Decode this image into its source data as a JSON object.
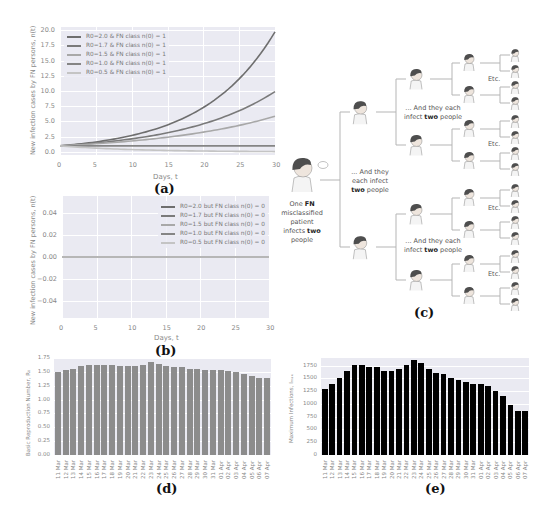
{
  "panels": {
    "a": {
      "label": "(a)"
    },
    "b": {
      "label": "(b)"
    },
    "c": {
      "label": "(c)"
    },
    "d": {
      "label": "(d)"
    },
    "e": {
      "label": "(e)"
    }
  },
  "tree": {
    "root_text_1": "One ",
    "root_bold_1": "FN",
    "root_text_2": "misclassified",
    "root_text_3": "patient",
    "root_text_4": "infects ",
    "root_bold_2": "two",
    "root_text_5": "people",
    "level1_text_1": "... And they",
    "level1_text_2": "each infect",
    "level1_bold": "two",
    "level1_text_3": " people",
    "level2_text_1": "... And they each",
    "level2_text_2": "infect ",
    "level2_bold": "two",
    "level2_text_3": " people",
    "etc": "Etc."
  },
  "chart_data": [
    {
      "id": "a",
      "type": "line",
      "title": "",
      "xlabel": "Days, t",
      "ylabel": "New infection cases by FN persons, n(t)",
      "xlim": [
        0,
        30
      ],
      "ylim": [
        -0.5,
        20.5
      ],
      "xticks": [
        "0",
        "5",
        "10",
        "15",
        "20",
        "25",
        "30"
      ],
      "yticks": [
        "0.0",
        "2.5",
        "5.0",
        "7.5",
        "10.0",
        "12.5",
        "15.0",
        "17.5",
        "20.0"
      ],
      "grid": true,
      "legend_position": "upper left",
      "x": [
        0,
        5,
        10,
        15,
        20,
        25,
        30
      ],
      "series": [
        {
          "name": "R0=2.0 & FN class n(0) = 1",
          "color": "#6e6e6e",
          "values": [
            1.0,
            1.6,
            2.7,
            4.4,
            7.3,
            12.0,
            19.7
          ]
        },
        {
          "name": "R0=1.7 & FN class n(0) = 1",
          "color": "#7a7a7a",
          "values": [
            1.0,
            1.47,
            2.15,
            3.15,
            4.6,
            6.75,
            9.9
          ]
        },
        {
          "name": "R0=1.5 & FN class n(0) = 1",
          "color": "#a8a8a8",
          "values": [
            1.0,
            1.35,
            1.8,
            2.45,
            3.3,
            4.4,
            5.85
          ]
        },
        {
          "name": "R0=1.0 & FN class n(0) = 1",
          "color": "#858585",
          "values": [
            1.0,
            1.0,
            1.0,
            1.0,
            1.0,
            1.0,
            1.0
          ]
        },
        {
          "name": "R0=0.5 & FN class n(0) = 1",
          "color": "#c4c4c4",
          "values": [
            1.0,
            0.62,
            0.4,
            0.25,
            0.16,
            0.1,
            0.06
          ]
        }
      ]
    },
    {
      "id": "b",
      "type": "line",
      "title": "",
      "xlabel": "Days, t",
      "ylabel": "New infection cases by FN persons, n(t)",
      "xlim": [
        0,
        30
      ],
      "ylim": [
        -0.055,
        0.055
      ],
      "xticks": [
        "0",
        "5",
        "10",
        "15",
        "20",
        "25",
        "30"
      ],
      "yticks": [
        "0.04",
        "0.02",
        "0.00",
        "−0.02",
        "−0.04"
      ],
      "grid": true,
      "legend_position": "upper right",
      "x": [
        0,
        30
      ],
      "series": [
        {
          "name": "R0=2.0 but FN class n(0) = 0",
          "color": "#6e6e6e",
          "values": [
            0,
            0
          ]
        },
        {
          "name": "R0=1.7 but FN class n(0) = 0",
          "color": "#7a7a7a",
          "values": [
            0,
            0
          ]
        },
        {
          "name": "R0=1.5 but FN class n(0) = 0",
          "color": "#a8a8a8",
          "values": [
            0,
            0
          ]
        },
        {
          "name": "R0=1.0 but FN class n(0) = 0",
          "color": "#858585",
          "values": [
            0,
            0
          ]
        },
        {
          "name": "R0=0.5 but FN class n(0) = 0",
          "color": "#c4c4c4",
          "values": [
            0,
            0
          ]
        }
      ]
    },
    {
      "id": "d",
      "type": "bar",
      "title": "",
      "xlabel": "",
      "ylabel": "Basic Reproduction Number, R₀",
      "ylim": [
        0,
        1.75
      ],
      "yticks": [
        "0.00",
        "0.25",
        "0.50",
        "0.75",
        "1.00",
        "1.25",
        "1.50",
        "1.75"
      ],
      "grid": true,
      "bar_color": "#8c8c8c",
      "categories": [
        "11 Mar",
        "12 Mar",
        "13 Mar",
        "14 Mar",
        "15 Mar",
        "16 Mar",
        "17 Mar",
        "18 Mar",
        "19 Mar",
        "20 Mar",
        "21 Mar",
        "22 Mar",
        "23 Mar",
        "24 Mar",
        "25 Mar",
        "26 Mar",
        "27 Mar",
        "28 Mar",
        "29 Mar",
        "30 Mar",
        "31 Mar",
        "01 Apr",
        "02 Apr",
        "03 Apr",
        "04 Apr",
        "05 Apr",
        "06 Apr",
        "07 Apr"
      ],
      "values": [
        1.5,
        1.53,
        1.56,
        1.6,
        1.63,
        1.63,
        1.62,
        1.62,
        1.6,
        1.6,
        1.61,
        1.63,
        1.67,
        1.65,
        1.61,
        1.59,
        1.58,
        1.56,
        1.55,
        1.54,
        1.53,
        1.53,
        1.52,
        1.49,
        1.46,
        1.42,
        1.39,
        1.39
      ]
    },
    {
      "id": "e",
      "type": "bar",
      "title": "",
      "xlabel": "",
      "ylabel": "Maximum Infections, Iₘₐₓ",
      "ylim": [
        0,
        1900
      ],
      "yticks": [
        "0",
        "250",
        "500",
        "750",
        "1000",
        "1250",
        "1500",
        "1750"
      ],
      "grid": true,
      "bar_color": "#000000",
      "categories": [
        "11 Mar",
        "12 Mar",
        "13 Mar",
        "14 Mar",
        "15 Mar",
        "16 Mar",
        "17 Mar",
        "18 Mar",
        "19 Mar",
        "20 Mar",
        "21 Mar",
        "22 Mar",
        "23 Mar",
        "24 Mar",
        "25 Mar",
        "26 Mar",
        "27 Mar",
        "28 Mar",
        "29 Mar",
        "30 Mar",
        "31 Mar",
        "01 Apr",
        "02 Apr",
        "03 Apr",
        "04 Apr",
        "05 Apr",
        "06 Apr",
        "07 Apr"
      ],
      "values": [
        1290,
        1400,
        1510,
        1650,
        1760,
        1760,
        1730,
        1730,
        1650,
        1650,
        1690,
        1760,
        1870,
        1800,
        1680,
        1610,
        1580,
        1510,
        1470,
        1430,
        1400,
        1400,
        1360,
        1250,
        1150,
        980,
        870,
        870
      ]
    }
  ]
}
